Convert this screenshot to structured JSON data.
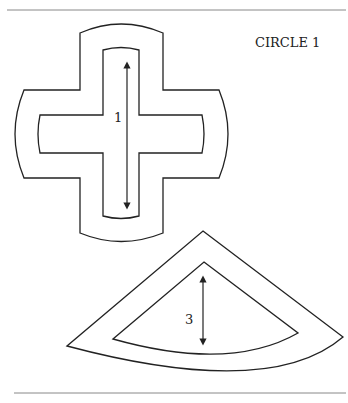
{
  "title": "CIRCLE 1",
  "shapes": [
    {
      "name": "cross",
      "label": "1",
      "arrow": "vertical double-headed"
    },
    {
      "name": "fan-sector",
      "label": "3",
      "arrow": "vertical double-headed"
    }
  ],
  "colors": {
    "stroke": "#222222",
    "rule": "#888888",
    "background": "#ffffff"
  }
}
